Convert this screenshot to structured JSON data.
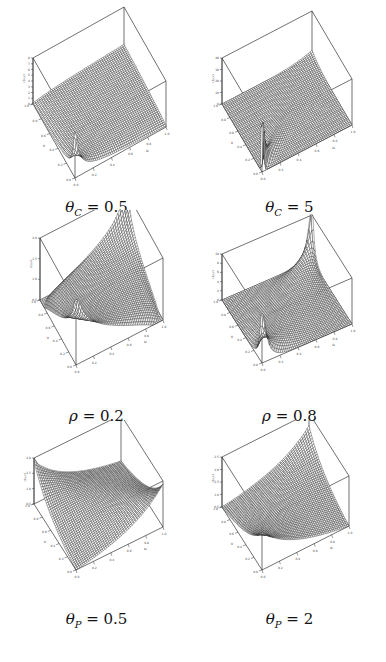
{
  "figure": {
    "panels": [
      {
        "id": "theta_c_0_5",
        "caption": {
          "symbol": "θ",
          "sub": "C",
          "rest": " = 0.5"
        },
        "zlabel": "c(u,v)",
        "zticks": [
          "0",
          "1",
          "2",
          "3",
          "4",
          "5",
          "6",
          "7",
          "8"
        ],
        "xticks": [
          "0.0",
          "0.2",
          "0.4",
          "0.6",
          "0.8",
          "1.0"
        ],
        "yticks": [
          "0.0",
          "0.2",
          "0.4",
          "0.6",
          "0.8",
          "1.0"
        ],
        "xlabel": "u",
        "ylabel": "v"
      },
      {
        "id": "theta_c_5",
        "caption": {
          "symbol": "θ",
          "sub": "C",
          "rest": " = 5"
        },
        "zlabel": "c(u,v)",
        "zticks": [
          "0",
          "10",
          "20",
          "30",
          "40"
        ],
        "xticks": [
          "0.0",
          "0.2",
          "0.4",
          "0.6",
          "0.8",
          "1.0"
        ],
        "yticks": [
          "0.0",
          "0.2",
          "0.4",
          "0.6",
          "0.8",
          "1.0"
        ],
        "xlabel": "u",
        "ylabel": "v"
      },
      {
        "id": "rho_0_2",
        "caption": {
          "symbol": "ρ",
          "sub": "",
          "rest": " = 0.2"
        },
        "zlabel": "c(u,v)",
        "zticks": [
          "0.5",
          "1.0",
          "1.5",
          "2.0"
        ],
        "xticks": [
          "0.0",
          "0.2",
          "0.4",
          "0.6",
          "0.8",
          "1.0"
        ],
        "yticks": [
          "0.0",
          "0.2",
          "0.4",
          "0.6",
          "0.8",
          "1.0"
        ],
        "xlabel": "u",
        "ylabel": "v"
      },
      {
        "id": "rho_0_8",
        "caption": {
          "symbol": "ρ",
          "sub": "",
          "rest": " = 0.8"
        },
        "zlabel": "c(u,v)",
        "zticks": [
          "0",
          "2",
          "4",
          "6",
          "8",
          "10"
        ],
        "xticks": [
          "0.0",
          "0.2",
          "0.4",
          "0.6",
          "0.8",
          "1.0"
        ],
        "yticks": [
          "0.0",
          "0.2",
          "0.4",
          "0.6",
          "0.8",
          "1.0"
        ],
        "xlabel": "u",
        "ylabel": "v"
      },
      {
        "id": "theta_p_0_5",
        "caption": {
          "symbol": "θ",
          "sub": "P",
          "rest": " = 0.5"
        },
        "zlabel": "c(u,v)",
        "zticks": [
          "0.5",
          "1.0",
          "1.5",
          "2.0"
        ],
        "xticks": [
          "0.0",
          "0.2",
          "0.4",
          "0.6",
          "0.8",
          "1.0"
        ],
        "yticks": [
          "0.0",
          "0.2",
          "0.4",
          "0.6",
          "0.8",
          "1.0"
        ],
        "xlabel": "u",
        "ylabel": "v"
      },
      {
        "id": "theta_p_2",
        "caption": {
          "symbol": "θ",
          "sub": "P",
          "rest": " = 2"
        },
        "zlabel": "c(u,v)",
        "zticks": [
          "0.5",
          "1.0",
          "1.5",
          "2.0",
          "2.5"
        ],
        "xticks": [
          "0.0",
          "0.2",
          "0.4",
          "0.6",
          "0.8",
          "1.0"
        ],
        "yticks": [
          "0.0",
          "0.2",
          "0.4",
          "0.6",
          "0.8",
          "1.0"
        ],
        "xlabel": "u",
        "ylabel": "v"
      }
    ]
  },
  "chart_data": [
    {
      "type": "surface",
      "title": "θ_C = 0.5",
      "xlabel": "u",
      "ylabel": "v",
      "zlabel": "c(u,v)",
      "xlim": [
        0,
        1
      ],
      "ylim": [
        0,
        1
      ],
      "zlim": [
        0,
        8
      ],
      "description": "Clayton copula density, theta=0.5; near-flat ~1 with sharp spike at (0,0)"
    },
    {
      "type": "surface",
      "title": "θ_C = 5",
      "xlabel": "u",
      "ylabel": "v",
      "zlabel": "c(u,v)",
      "xlim": [
        0,
        1
      ],
      "ylim": [
        0,
        1
      ],
      "zlim": [
        0,
        40
      ],
      "description": "Clayton copula density, theta=5; strong lower-tail spike along diagonal at (0,0)"
    },
    {
      "type": "surface",
      "title": "ρ = 0.2",
      "xlabel": "u",
      "ylabel": "v",
      "zlabel": "c(u,v)",
      "xlim": [
        0,
        1
      ],
      "ylim": [
        0,
        1
      ],
      "zlim": [
        0.5,
        2.0
      ],
      "description": "Gaussian copula density, rho=0.2; mild rise at (0,0) and (1,1) corners"
    },
    {
      "type": "surface",
      "title": "ρ = 0.8",
      "xlabel": "u",
      "ylabel": "v",
      "zlabel": "c(u,v)",
      "xlim": [
        0,
        1
      ],
      "ylim": [
        0,
        1
      ],
      "zlim": [
        0,
        10
      ],
      "description": "Gaussian copula density, rho=0.8; sharp peaks at (0,0) and (1,1)"
    },
    {
      "type": "surface",
      "title": "θ_P = 0.5",
      "xlabel": "u",
      "ylabel": "v",
      "zlabel": "c(u,v)",
      "xlim": [
        0,
        1
      ],
      "ylim": [
        0,
        1
      ],
      "zlim": [
        0.5,
        2.0
      ],
      "description": "Plackett copula density, theta=0.5; saddle with high off-diagonal corners"
    },
    {
      "type": "surface",
      "title": "θ_P = 2",
      "xlabel": "u",
      "ylabel": "v",
      "zlabel": "c(u,v)",
      "xlim": [
        0,
        1
      ],
      "ylim": [
        0,
        1
      ],
      "zlim": [
        0.5,
        2.5
      ],
      "description": "Plackett copula density, theta=2; high at (0,0) and (1,1) corners"
    }
  ],
  "layout": {
    "line_color": "#1a1a1a",
    "box_color": "#333333"
  }
}
